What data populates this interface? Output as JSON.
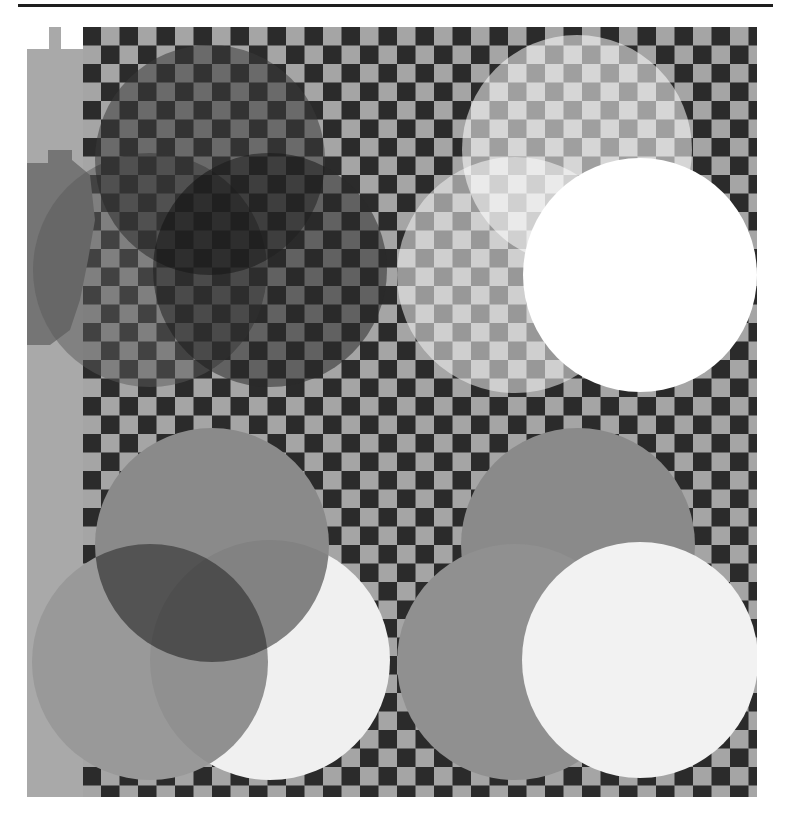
{
  "page": {
    "width": 791,
    "height": 816,
    "background": "#ffffff"
  },
  "top_rule": {
    "x": 18,
    "y": 4,
    "width": 755,
    "height": 3,
    "color": "#1e1e1e"
  },
  "checkerboard": {
    "x": 27,
    "y": 27,
    "width": 730,
    "height": 770,
    "cell": 18.5,
    "dark": "#2b2b2b",
    "light": "#a5a5a5"
  },
  "left_strip": {
    "color": "#a9a9a9",
    "dark_shape_color": "#757575",
    "white_cells": [
      {
        "x": 27,
        "y": 27,
        "w": 22,
        "h": 22
      },
      {
        "x": 61,
        "y": 27,
        "w": 22,
        "h": 22
      }
    ]
  },
  "quadrants": [
    {
      "name": "top-left",
      "blend": "multiply",
      "circles": [
        {
          "cx": 210,
          "cy": 160,
          "r": 115,
          "fill": "#3a3a3a",
          "opacity": 0.55
        },
        {
          "cx": 150,
          "cy": 270,
          "r": 117,
          "fill": "#5a5a5a",
          "opacity": 0.5
        },
        {
          "cx": 270,
          "cy": 270,
          "r": 117,
          "fill": "#2a2a2a",
          "opacity": 0.55
        }
      ]
    },
    {
      "name": "top-right",
      "blend": "screen",
      "circles": [
        {
          "cx": 577,
          "cy": 150,
          "r": 115,
          "fill": "#ffffff",
          "opacity": 0.55
        },
        {
          "cx": 515,
          "cy": 275,
          "r": 118,
          "fill": "#f2f2f2",
          "opacity": 0.55
        },
        {
          "cx": 640,
          "cy": 275,
          "r": 117,
          "fill": "#ffffff",
          "opacity": 1
        }
      ]
    },
    {
      "name": "bottom-left",
      "blend": "multiply",
      "circles": [
        {
          "cx": 212,
          "cy": 545,
          "r": 117,
          "fill": "#8a8a8a",
          "opacity": 1
        },
        {
          "cx": 150,
          "cy": 662,
          "r": 118,
          "fill": "#999999",
          "opacity": 1
        },
        {
          "cx": 270,
          "cy": 660,
          "r": 120,
          "fill": "#f0f0f0",
          "opacity": 1
        }
      ]
    },
    {
      "name": "bottom-right",
      "blend": "lighten",
      "circles": [
        {
          "cx": 578,
          "cy": 545,
          "r": 117,
          "fill": "#8a8a8a",
          "opacity": 1
        },
        {
          "cx": 515,
          "cy": 662,
          "r": 118,
          "fill": "#909090",
          "opacity": 1
        },
        {
          "cx": 640,
          "cy": 660,
          "r": 118,
          "fill": "#f2f2f2",
          "opacity": 1
        }
      ]
    }
  ]
}
